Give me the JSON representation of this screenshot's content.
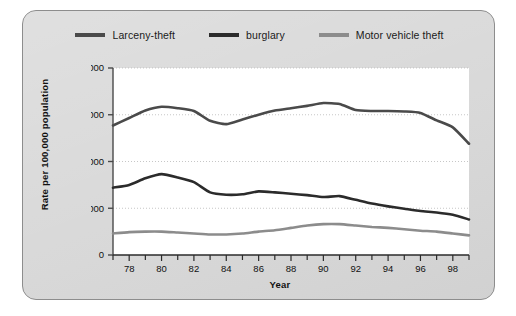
{
  "figure": {
    "card_bg": "#d8d8d8",
    "card_border": "#8d8d8d",
    "plot_bg": "#ffffff"
  },
  "legend": {
    "position": "top-center",
    "items": [
      {
        "label": "Larceny-theft",
        "color": "#4a4a4a",
        "icon": "line-swatch-icon"
      },
      {
        "label": "burglary",
        "color": "#2b2b2b",
        "icon": "line-swatch-icon"
      },
      {
        "label": "Motor vehicle theft",
        "color": "#8c8c8c",
        "icon": "line-swatch-icon"
      }
    ]
  },
  "axes": {
    "y_title": "Rate per 100,000 population",
    "x_title": "Year",
    "y_ticks": [
      "0",
      "1,000",
      "2,000",
      "3,000",
      "4,000"
    ],
    "x_ticks": [
      "78",
      "80",
      "82",
      "84",
      "86",
      "88",
      "90",
      "92",
      "94",
      "96",
      "98"
    ]
  },
  "chart_data": {
    "type": "line",
    "title": "",
    "subtitle": "",
    "xlabel": "Year",
    "ylabel": "Rate per 100,000 population",
    "xlim": [
      1977,
      1999
    ],
    "ylim": [
      0,
      4000
    ],
    "ytick_values": [
      0,
      1000,
      2000,
      3000,
      4000
    ],
    "ytick_labels": [
      "0",
      "1,000",
      "2,000",
      "3,000",
      "4,000"
    ],
    "xtick_values": [
      1978,
      1980,
      1982,
      1984,
      1986,
      1988,
      1990,
      1992,
      1994,
      1996,
      1998
    ],
    "xtick_labels": [
      "78",
      "80",
      "82",
      "84",
      "86",
      "88",
      "90",
      "92",
      "94",
      "96",
      "98"
    ],
    "minor_xticks_every": 1,
    "grid": {
      "horizontal": true,
      "vertical": false,
      "style": "dotted",
      "color": "#b9b9b9"
    },
    "legend_position": "top-center",
    "x": [
      1977,
      1978,
      1979,
      1980,
      1981,
      1982,
      1983,
      1984,
      1985,
      1986,
      1987,
      1988,
      1989,
      1990,
      1991,
      1992,
      1993,
      1994,
      1995,
      1996,
      1997,
      1998,
      1999
    ],
    "series": [
      {
        "name": "Larceny-theft",
        "color": "#4a4a4a",
        "values": [
          2770,
          2930,
          3090,
          3170,
          3140,
          3080,
          2870,
          2800,
          2900,
          3000,
          3090,
          3140,
          3190,
          3250,
          3230,
          3100,
          3080,
          3080,
          3070,
          3040,
          2880,
          2730,
          2380
        ]
      },
      {
        "name": "burglary",
        "color": "#2b2b2b",
        "values": [
          1440,
          1500,
          1640,
          1730,
          1660,
          1560,
          1340,
          1290,
          1300,
          1360,
          1340,
          1310,
          1280,
          1240,
          1260,
          1180,
          1100,
          1040,
          990,
          940,
          910,
          860,
          760
        ]
      },
      {
        "name": "Motor vehicle theft",
        "color": "#8c8c8c",
        "values": [
          460,
          490,
          500,
          500,
          480,
          460,
          440,
          440,
          460,
          500,
          530,
          580,
          630,
          660,
          660,
          630,
          600,
          580,
          550,
          520,
          500,
          460,
          420
        ]
      }
    ]
  }
}
